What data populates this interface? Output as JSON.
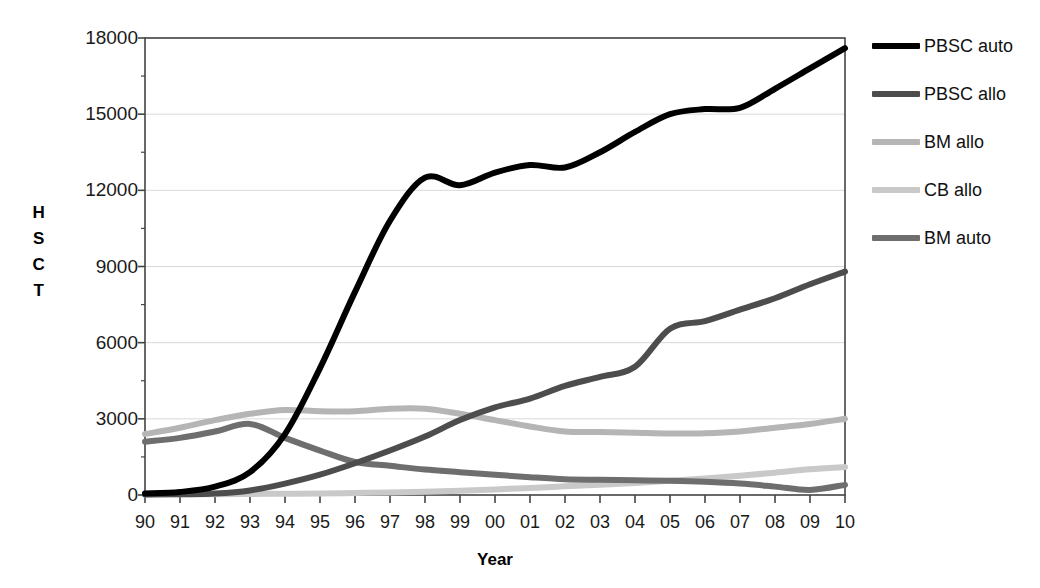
{
  "chart_data": {
    "type": "line",
    "title": "",
    "xlabel": "Year",
    "ylabel": "HSCT",
    "ylabel_letters": [
      "H",
      "S",
      "C",
      "T"
    ],
    "x": [
      "90",
      "91",
      "92",
      "93",
      "94",
      "95",
      "96",
      "97",
      "98",
      "99",
      "00",
      "01",
      "02",
      "03",
      "04",
      "05",
      "06",
      "07",
      "08",
      "09",
      "10"
    ],
    "categories": [
      "90",
      "91",
      "92",
      "93",
      "94",
      "95",
      "96",
      "97",
      "98",
      "99",
      "00",
      "01",
      "02",
      "03",
      "04",
      "05",
      "06",
      "07",
      "08",
      "09",
      "10"
    ],
    "xlim": [
      0,
      20
    ],
    "ylim": [
      0,
      18000
    ],
    "yticks": [
      0,
      3000,
      6000,
      9000,
      12000,
      15000,
      18000
    ],
    "ytick_labels": [
      "0",
      "3000",
      "6000",
      "9000",
      "12000",
      "15000",
      "18000"
    ],
    "grid": true,
    "grid_axis": "y",
    "legend_position": "right",
    "series": [
      {
        "name": "PBSC auto",
        "color": "#000000",
        "width": 6,
        "values": [
          60,
          120,
          330,
          900,
          2400,
          5000,
          8000,
          10800,
          12500,
          12200,
          12700,
          13000,
          12900,
          13500,
          14300,
          15000,
          15200,
          15250,
          16000,
          16800,
          17600
        ]
      },
      {
        "name": "PBSC allo",
        "color": "#4d4d4d",
        "width": 6,
        "values": [
          20,
          30,
          60,
          180,
          450,
          800,
          1250,
          1750,
          2300,
          2950,
          3450,
          3800,
          4300,
          4650,
          5050,
          6550,
          6850,
          7300,
          7750,
          8300,
          8800
        ]
      },
      {
        "name": "BM allo",
        "color": "#b5b5b5",
        "width": 6,
        "values": [
          2400,
          2650,
          2950,
          3200,
          3350,
          3300,
          3300,
          3400,
          3400,
          3200,
          2950,
          2700,
          2500,
          2480,
          2450,
          2420,
          2430,
          2500,
          2650,
          2800,
          3000
        ]
      },
      {
        "name": "CB allo",
        "color": "#c9c9c9",
        "width": 6,
        "values": [
          20,
          25,
          30,
          40,
          50,
          60,
          80,
          100,
          130,
          170,
          220,
          280,
          340,
          400,
          470,
          560,
          650,
          760,
          880,
          1010,
          1100
        ]
      },
      {
        "name": "BM auto",
        "color": "#6e6e6e",
        "width": 6,
        "values": [
          2100,
          2250,
          2500,
          2800,
          2250,
          1750,
          1300,
          1150,
          1000,
          900,
          800,
          700,
          620,
          600,
          580,
          560,
          520,
          450,
          330,
          200,
          400
        ]
      }
    ]
  },
  "legend": {
    "items": [
      {
        "label": "PBSC auto",
        "color": "#000000"
      },
      {
        "label": "PBSC allo",
        "color": "#4d4d4d"
      },
      {
        "label": "BM allo",
        "color": "#b5b5b5"
      },
      {
        "label": "CB allo",
        "color": "#c9c9c9"
      },
      {
        "label": "BM auto",
        "color": "#6e6e6e"
      }
    ]
  },
  "axes": {
    "frame_color": "#444444",
    "grid_color": "#d9d9d9",
    "tick_color": "#444444"
  }
}
